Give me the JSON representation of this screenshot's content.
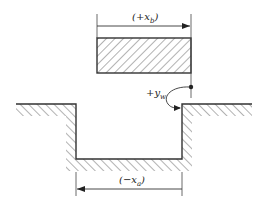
{
  "diagram": {
    "type": "punch-die clearance / displacement sketch",
    "labels": {
      "top_dimension": {
        "open": "(+x",
        "sub": "b",
        "close": ")"
      },
      "bottom_dimension": {
        "open": "(−x",
        "sub": "a",
        "close": ")"
      },
      "rotation": {
        "main": "+y",
        "sub": "w"
      }
    },
    "colors": {
      "stroke": "#333333",
      "hatch": "#555555",
      "background": "#ffffff"
    }
  }
}
